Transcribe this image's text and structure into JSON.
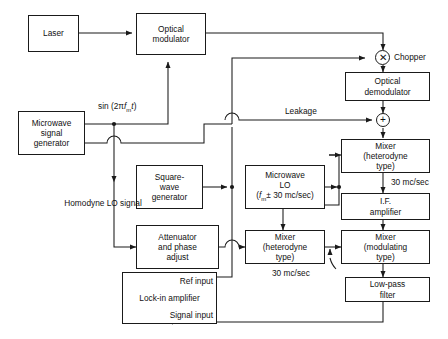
{
  "diagram": {
    "line_color": "#1a1a1a",
    "background": "#ffffff",
    "blocks": [
      {
        "id": "laser",
        "lines": [
          "Laser"
        ]
      },
      {
        "id": "optical-modulator",
        "lines": [
          "Optical",
          "modulator"
        ]
      },
      {
        "id": "microwave-signal-generator",
        "lines": [
          "Microwave",
          "signal",
          "generator"
        ]
      },
      {
        "id": "optical-demodulator",
        "lines": [
          "Optical",
          "demodulator"
        ]
      },
      {
        "id": "square-wave-generator",
        "lines": [
          "Square-",
          "wave",
          "generator"
        ]
      },
      {
        "id": "microwave-lo",
        "lines": [
          "Microwave",
          "LO"
        ],
        "formula_line": "(fm ± 30 mc/sec)"
      },
      {
        "id": "mixer-heterodyne-top",
        "lines": [
          "Mixer",
          "(heterodyne",
          "type)"
        ]
      },
      {
        "id": "if-amplifier",
        "lines": [
          "I.F.",
          "amplifier"
        ]
      },
      {
        "id": "attenuator-phase-adjust",
        "lines": [
          "Attenuator",
          "and phase",
          "adjust"
        ]
      },
      {
        "id": "mixer-heterodyne-bottom",
        "lines": [
          "Mixer",
          "(heterodyne",
          "type)"
        ]
      },
      {
        "id": "mixer-modulating",
        "lines": [
          "Mixer",
          "(modulating",
          "type)"
        ]
      },
      {
        "id": "low-pass-filter",
        "lines": [
          "Low-pass",
          "filter"
        ]
      },
      {
        "id": "lock-in-amplifier",
        "lines": [
          "Lock-in",
          "amplifier"
        ],
        "ref_input": "Ref input",
        "signal_input": "Signal input"
      }
    ],
    "nodes": [
      {
        "id": "chopper",
        "glyph": "✕",
        "label": "Chopper"
      },
      {
        "id": "summing-junction",
        "glyph": "+",
        "label": ""
      }
    ],
    "wire_labels": {
      "sin_drive": "sin (2πfmt)",
      "leakage": "Leakage",
      "homodyne_lo_line1": "Homodyne",
      "homodyne_lo_line2": "LO signal",
      "if_rate": "30 mc/sec",
      "mixer_rate": "30 mc/sec"
    }
  }
}
